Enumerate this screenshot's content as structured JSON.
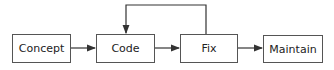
{
  "diagram": {
    "nodes": [
      {
        "id": "concept",
        "label": "Concept"
      },
      {
        "id": "code",
        "label": "Code"
      },
      {
        "id": "fix",
        "label": "Fix"
      },
      {
        "id": "maintain",
        "label": "Maintain"
      }
    ],
    "edges": [
      {
        "from": "concept",
        "to": "code"
      },
      {
        "from": "code",
        "to": "fix"
      },
      {
        "from": "fix",
        "to": "code",
        "type": "feedback-loop"
      },
      {
        "from": "fix",
        "to": "maintain"
      }
    ],
    "colors": {
      "stroke": "#555555",
      "text": "#222222",
      "background": "#ffffff"
    }
  }
}
